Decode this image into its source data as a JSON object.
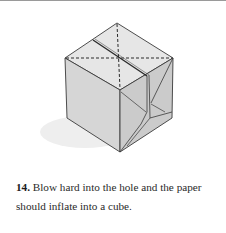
{
  "step": {
    "number": "14.",
    "text": "Blow hard into the hole and the paper should inflate into a cube."
  },
  "figure": {
    "colors": {
      "top_face": "#e4e4e4",
      "left_face": "#d2d2d2",
      "right_face": "#c8c8c8",
      "edge": "#3a3a3a",
      "shadow": "#ececec"
    }
  }
}
